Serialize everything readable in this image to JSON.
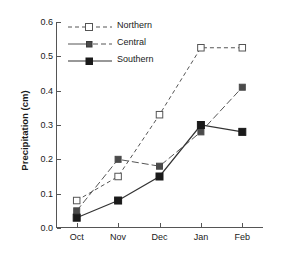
{
  "chart_data": {
    "type": "line",
    "title": "",
    "xlabel": "",
    "ylabel": "Precipitation (cm)",
    "categories": [
      "Oct",
      "Nov",
      "Dec",
      "Jan",
      "Feb"
    ],
    "ylim": [
      0.0,
      0.6
    ],
    "yticks": [
      "0.0",
      "0.1",
      "0.2",
      "0.3",
      "0.4",
      "0.5",
      "0.6"
    ],
    "ytick_values": [
      0.0,
      0.1,
      0.2,
      0.3,
      0.4,
      0.5,
      0.6
    ],
    "grid": false,
    "legend_position": "upper left inside",
    "series": [
      {
        "name": "Northern",
        "values": [
          0.08,
          0.15,
          0.33,
          0.525,
          0.525
        ],
        "linestyle": "dashed",
        "marker": "open-square",
        "color": "#555555",
        "marker_fill": "#ffffff"
      },
      {
        "name": "Central",
        "values": [
          0.05,
          0.2,
          0.18,
          0.28,
          0.41
        ],
        "linestyle": "dashdot",
        "marker": "filled-square",
        "color": "#555555",
        "marker_fill": "#4a4a4a"
      },
      {
        "name": "Southern",
        "values": [
          0.03,
          0.08,
          0.15,
          0.3,
          0.28
        ],
        "linestyle": "solid",
        "marker": "filled-square",
        "color": "#333333",
        "marker_fill": "#1a1a1a"
      }
    ]
  },
  "legend": {
    "items": [
      {
        "label": "Northern"
      },
      {
        "label": "Central"
      },
      {
        "label": "Southern"
      }
    ]
  }
}
